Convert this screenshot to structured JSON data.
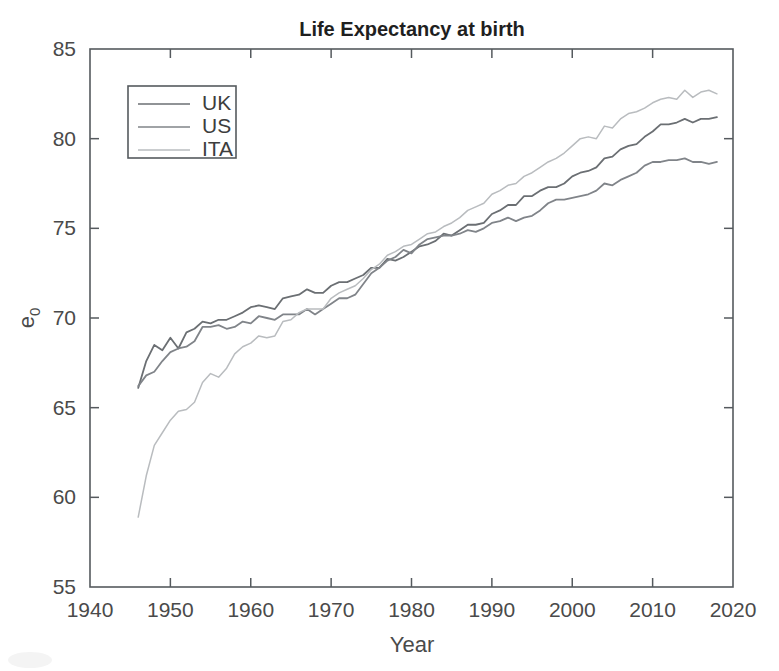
{
  "chart_data": {
    "type": "line",
    "title": "Life Expectancy at birth",
    "xlabel": "Year",
    "ylabel": "e_0",
    "ylabel_display": "e",
    "ylabel_subscript": "0",
    "xlim": [
      1940,
      2020
    ],
    "ylim": [
      55,
      85
    ],
    "xticks": [
      1940,
      1950,
      1960,
      1970,
      1980,
      1990,
      2000,
      2010,
      2020
    ],
    "xtick_labels": [
      "1940",
      "1950",
      "1960",
      "1970",
      "1980",
      "1990",
      "2000",
      "2010",
      "2020"
    ],
    "yticks": [
      55,
      60,
      65,
      70,
      75,
      80,
      85
    ],
    "ytick_labels": [
      "55",
      "60",
      "65",
      "70",
      "75",
      "80",
      "85"
    ],
    "grid": false,
    "legend_position": "upper left",
    "legend_entries": [
      "UK",
      "US",
      "ITA"
    ],
    "x": [
      1946,
      1947,
      1948,
      1949,
      1950,
      1951,
      1952,
      1953,
      1954,
      1955,
      1956,
      1957,
      1958,
      1959,
      1960,
      1961,
      1962,
      1963,
      1964,
      1965,
      1966,
      1967,
      1968,
      1969,
      1970,
      1971,
      1972,
      1973,
      1974,
      1975,
      1976,
      1977,
      1978,
      1979,
      1980,
      1981,
      1982,
      1983,
      1984,
      1985,
      1986,
      1987,
      1988,
      1989,
      1990,
      1991,
      1992,
      1993,
      1994,
      1995,
      1996,
      1997,
      1998,
      1999,
      2000,
      2001,
      2002,
      2003,
      2004,
      2005,
      2006,
      2007,
      2008,
      2009,
      2010,
      2011,
      2012,
      2013,
      2014,
      2015,
      2016,
      2017,
      2018
    ],
    "series": [
      {
        "name": "UK",
        "color": "#6b6f73",
        "values": [
          66.1,
          67.6,
          68.5,
          68.2,
          68.9,
          68.3,
          69.2,
          69.4,
          69.8,
          69.7,
          69.9,
          69.9,
          70.1,
          70.3,
          70.6,
          70.7,
          70.6,
          70.5,
          71.1,
          71.2,
          71.3,
          71.6,
          71.4,
          71.4,
          71.8,
          72.0,
          72.0,
          72.2,
          72.4,
          72.8,
          72.8,
          73.3,
          73.2,
          73.4,
          73.7,
          74.0,
          74.1,
          74.3,
          74.7,
          74.6,
          74.9,
          75.2,
          75.2,
          75.3,
          75.8,
          76.0,
          76.3,
          76.3,
          76.8,
          76.8,
          77.1,
          77.3,
          77.3,
          77.5,
          77.9,
          78.1,
          78.2,
          78.4,
          78.9,
          79.0,
          79.4,
          79.6,
          79.7,
          80.1,
          80.4,
          80.8,
          80.8,
          80.9,
          81.1,
          80.9,
          81.1,
          81.1,
          81.2
        ]
      },
      {
        "name": "US",
        "color": "#808489",
        "values": [
          66.2,
          66.8,
          67.0,
          67.6,
          68.1,
          68.3,
          68.4,
          68.7,
          69.5,
          69.5,
          69.6,
          69.4,
          69.5,
          69.8,
          69.7,
          70.1,
          70.0,
          69.9,
          70.2,
          70.2,
          70.2,
          70.5,
          70.2,
          70.5,
          70.8,
          71.1,
          71.1,
          71.3,
          71.9,
          72.5,
          72.8,
          73.2,
          73.4,
          73.8,
          73.6,
          74.1,
          74.4,
          74.5,
          74.6,
          74.6,
          74.7,
          74.9,
          74.8,
          75.0,
          75.3,
          75.4,
          75.6,
          75.4,
          75.6,
          75.7,
          76.0,
          76.4,
          76.6,
          76.6,
          76.7,
          76.8,
          76.9,
          77.1,
          77.5,
          77.4,
          77.7,
          77.9,
          78.1,
          78.5,
          78.7,
          78.7,
          78.8,
          78.8,
          78.9,
          78.7,
          78.7,
          78.6,
          78.7
        ]
      },
      {
        "name": "ITA",
        "color": "#b9bcbf",
        "values": [
          58.9,
          61.2,
          62.9,
          63.6,
          64.3,
          64.8,
          64.9,
          65.3,
          66.4,
          66.9,
          66.7,
          67.2,
          68.0,
          68.4,
          68.6,
          69.0,
          68.9,
          69.0,
          69.8,
          69.9,
          70.3,
          70.5,
          70.5,
          70.5,
          71.1,
          71.4,
          71.6,
          71.8,
          72.2,
          72.7,
          73.0,
          73.5,
          73.7,
          74.0,
          74.1,
          74.4,
          74.7,
          74.8,
          75.1,
          75.3,
          75.6,
          76.0,
          76.2,
          76.4,
          76.9,
          77.1,
          77.4,
          77.5,
          77.9,
          78.1,
          78.4,
          78.7,
          78.9,
          79.2,
          79.6,
          80.0,
          80.1,
          80.0,
          80.7,
          80.6,
          81.1,
          81.4,
          81.5,
          81.7,
          82.0,
          82.2,
          82.3,
          82.2,
          82.7,
          82.3,
          82.6,
          82.7,
          82.5
        ]
      }
    ]
  },
  "figure": {
    "background_color": "#ffffff",
    "axis_color": "#555a5e",
    "text_color": "#4a4a4a",
    "title_color": "#1f1f1f"
  }
}
